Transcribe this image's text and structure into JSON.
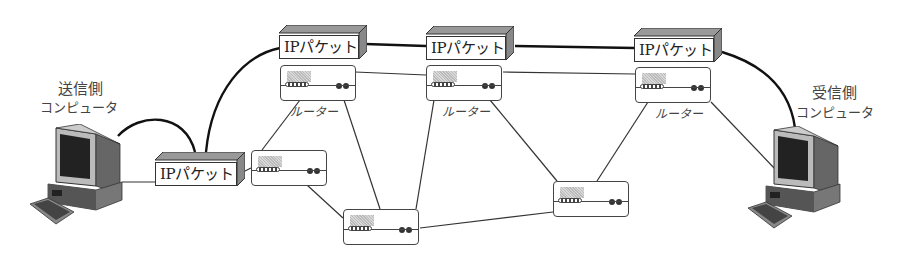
{
  "diagram": {
    "type": "network-routing",
    "sender": {
      "label_line1": "送信側",
      "label_line2": "コンピュータ"
    },
    "receiver": {
      "label_line1": "受信側",
      "label_line2": "コンピュータ"
    },
    "packets": [
      {
        "id": "p0",
        "label": "IPパケット"
      },
      {
        "id": "p1",
        "label": "IPパケット"
      },
      {
        "id": "p2",
        "label": "IPパケット"
      },
      {
        "id": "p3",
        "label": "IPパケット"
      }
    ],
    "routers": [
      {
        "id": "rA",
        "label": "ルーター"
      },
      {
        "id": "rB",
        "label": ""
      },
      {
        "id": "rC",
        "label": ""
      },
      {
        "id": "rD",
        "label": "ルーター"
      },
      {
        "id": "rE",
        "label": ""
      },
      {
        "id": "rF",
        "label": "ルーター"
      }
    ],
    "path_description": "送信側コンピュータ → IPパケット → ルーター → ルーター → ルーター → 受信側コンピュータ",
    "colors": {
      "line": "#222222",
      "box_border": "#333333",
      "shade": "#999999",
      "background": "#ffffff"
    }
  }
}
